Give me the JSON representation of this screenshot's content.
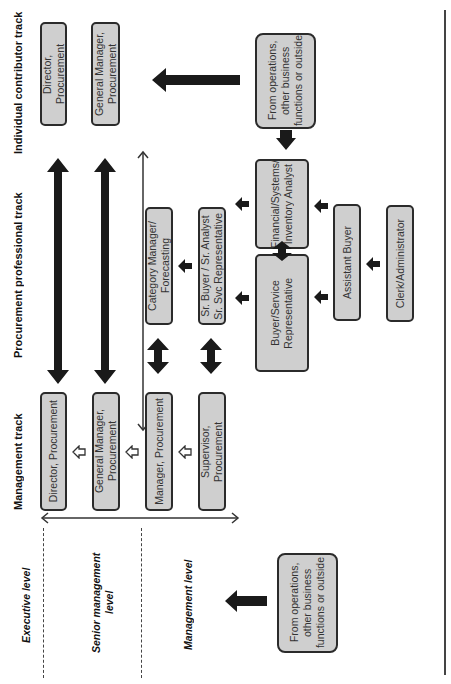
{
  "tracks": {
    "individual": "Individual contributor track",
    "professional": "Procurement professional track",
    "management": "Management track"
  },
  "levels": {
    "executive": "Executive level",
    "senior": "Senior management level",
    "management": "Management level"
  },
  "individual_contributor": [
    {
      "label": "Director, Procurement"
    },
    {
      "label": "General Manager,\nProcurement"
    }
  ],
  "professional": {
    "category_manager": "Category Manager/\nForecasting",
    "sr_buyer": "Sr. Buyer / Sr. Analyst\nSr. Svc Representative",
    "financial": "Financial/Systems/\nInventory Analyst",
    "buyer_service": "Buyer/Service\nRepresentative",
    "assistant_buyer": "Assistant Buyer",
    "clerk": "Clerk/Administrator"
  },
  "management": [
    {
      "label": "Director, Procurement"
    },
    {
      "label": "General Manager,\nProcurement"
    },
    {
      "label": "Manager, Procurement"
    },
    {
      "label": "Supervisor, Procurement"
    }
  ],
  "external_sources": {
    "top": "From operations,\nother business\nfunctions or outside",
    "bottom": "From operations,\nother business\nfunctions or outside"
  },
  "colors": {
    "box_fill": "#cfcfcf",
    "box_border": "#2b2b2b",
    "arrow": "#1a1a1a"
  }
}
